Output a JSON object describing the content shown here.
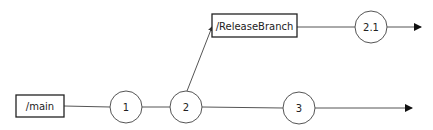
{
  "diagram": {
    "type": "branching-flow",
    "colors": {
      "stroke": "#222222",
      "line": "#555555",
      "background": "#ffffff"
    },
    "boxes": [
      {
        "id": "main",
        "label": "/main",
        "x": 16,
        "y": 95,
        "w": 48,
        "h": 22
      },
      {
        "id": "release",
        "label": "/ReleaseBranch",
        "x": 212,
        "y": 14,
        "w": 85,
        "h": 23
      }
    ],
    "nodes": [
      {
        "id": "n1",
        "label": "1",
        "cx": 126,
        "cy": 107,
        "r": 16
      },
      {
        "id": "n2",
        "label": "2",
        "cx": 186,
        "cy": 107,
        "r": 16
      },
      {
        "id": "n3",
        "label": "3",
        "cx": 299,
        "cy": 108,
        "r": 16
      },
      {
        "id": "n21",
        "label": "2.1",
        "cx": 371,
        "cy": 27,
        "r": 16
      }
    ],
    "edges": [
      {
        "from": "main",
        "to": "n1"
      },
      {
        "from": "n1",
        "to": "n2"
      },
      {
        "from": "n2",
        "to": "n3"
      },
      {
        "from": "n2",
        "to": "release",
        "arrow": true
      },
      {
        "from": "release",
        "to": "n21"
      },
      {
        "from": "n3",
        "to": "end-main",
        "arrow": true
      },
      {
        "from": "n21",
        "to": "end-release",
        "arrow": true
      }
    ]
  }
}
